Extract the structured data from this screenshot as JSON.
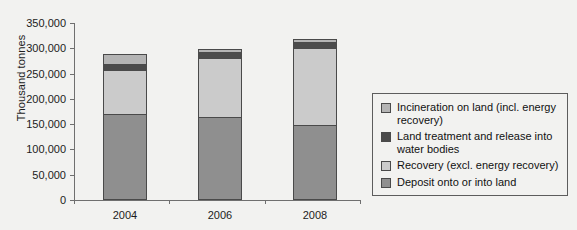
{
  "chart_data": {
    "type": "bar",
    "subtype": "stacked-vertical",
    "title": "",
    "xlabel": "",
    "ylabel": "Thousand tonnes",
    "categories": [
      "2004",
      "2006",
      "2008"
    ],
    "ylim": [
      0,
      350000
    ],
    "ytick_values": [
      0,
      50000,
      100000,
      150000,
      200000,
      250000,
      300000,
      350000
    ],
    "ytick_labels": [
      "0",
      "50,000",
      "100,000",
      "150,000",
      "200,000",
      "250,000",
      "300,000",
      "350,000"
    ],
    "grid": false,
    "legend_position": "right",
    "stack_order_bottom_to_top": [
      "Deposit onto or into land",
      "Recovery (excl. energy recovery)",
      "Land treatment and release into water bodies",
      "Incineration on land (incl. energy recovery)"
    ],
    "series": [
      {
        "name": "Deposit onto or into land",
        "color": "#8f8f8f",
        "values": [
          170000,
          164000,
          148000
        ]
      },
      {
        "name": "Recovery (excl. energy recovery)",
        "color": "#cbcbcb",
        "values": [
          87000,
          116000,
          152000
        ]
      },
      {
        "name": "Land treatment and release into water bodies",
        "color": "#4b4b4b",
        "values": [
          12000,
          12000,
          12000
        ]
      },
      {
        "name": "Incineration on land (incl. energy recovery)",
        "color": "#b4b4b4",
        "values": [
          19000,
          6000,
          6000
        ]
      }
    ],
    "totals": [
      288000,
      298000,
      318000
    ]
  },
  "axis": {
    "y_title": "Thousand tonnes"
  },
  "legend": {
    "items": [
      {
        "label": "Incineration on land (incl. energy recovery)",
        "color": "#b4b4b4",
        "name": "incineration-on-land"
      },
      {
        "label": "Land treatment and release into water bodies",
        "color": "#4b4b4b",
        "name": "land-treatment-water-bodies"
      },
      {
        "label": "Recovery (excl. energy recovery)",
        "color": "#cbcbcb",
        "name": "recovery-excl-energy"
      },
      {
        "label": "Deposit onto or into land",
        "color": "#8f8f8f",
        "name": "deposit-onto-into-land"
      }
    ]
  },
  "colors": {
    "background": "#f2f2f0",
    "axis": "#6f6f6f",
    "bar_outline": "#4a4a4a",
    "text": "#1c1c1c"
  }
}
